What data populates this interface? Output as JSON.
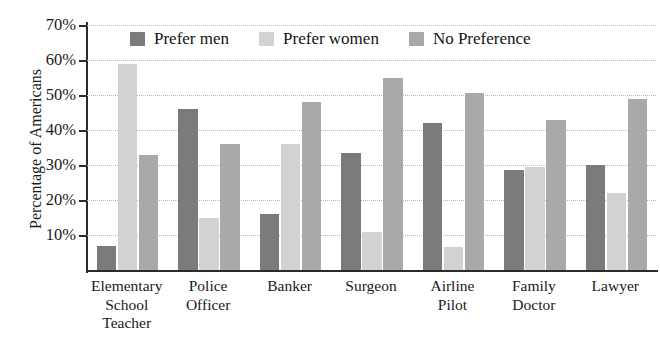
{
  "chart_data": {
    "type": "bar",
    "title": "Men or Women in Various Jobs",
    "xlabel": "",
    "ylabel": "Percentage of Americans",
    "ylim": [
      0,
      70
    ],
    "ytick_labels": [
      "70%",
      "60%",
      "50%",
      "40%",
      "30%",
      "20%",
      "10%"
    ],
    "ytick_values": [
      70,
      60,
      50,
      40,
      30,
      20,
      10
    ],
    "grid": true,
    "legend_position": "top-center-inside",
    "categories": [
      "Elementary School Teacher",
      "Police Officer",
      "Banker",
      "Surgeon",
      "Airline Pilot",
      "Family Doctor",
      "Lawyer"
    ],
    "category_lines": [
      [
        "Elementary",
        "School",
        "Teacher"
      ],
      [
        "Police",
        "Officer"
      ],
      [
        "Banker"
      ],
      [
        "Surgeon"
      ],
      [
        "Airline",
        "Pilot"
      ],
      [
        "Family",
        "Doctor"
      ],
      [
        "Lawyer"
      ]
    ],
    "series": [
      {
        "name": "Prefer men",
        "color": "#7b7b7b",
        "values": [
          7,
          46,
          16,
          33.5,
          42,
          28.5,
          30
        ]
      },
      {
        "name": "Prefer women",
        "color": "#d2d2d2",
        "values": [
          59,
          15,
          36,
          11,
          6.5,
          29.5,
          22
        ]
      },
      {
        "name": "No Preference",
        "color": "#a9a9a9",
        "values": [
          33,
          36,
          48,
          55,
          50.5,
          43,
          49
        ]
      }
    ]
  },
  "legend": {
    "items": [
      {
        "label": "Prefer men",
        "color": "#7b7b7b"
      },
      {
        "label": "Prefer women",
        "color": "#d2d2d2"
      },
      {
        "label": "No Preference",
        "color": "#a9a9a9"
      }
    ]
  }
}
